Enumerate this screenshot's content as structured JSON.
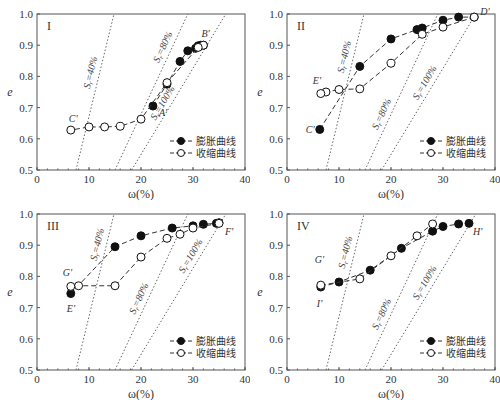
{
  "chart_data": [
    {
      "type": "line",
      "panel": "I",
      "xlabel": "ω(%)",
      "ylabel": "e",
      "xlim": [
        0,
        40
      ],
      "ylim": [
        0.5,
        1.0
      ],
      "xticks": [
        "0",
        "10",
        "20",
        "30",
        "40"
      ],
      "yticks": [
        "0.5",
        "0.6",
        "0.7",
        "0.8",
        "0.9",
        "1.0"
      ],
      "legend": [
        "膨胀曲线",
        "收缩曲线"
      ],
      "legend_position": "lower right",
      "series": [
        {
          "name": "膨胀曲线",
          "marker": "filled-circle",
          "x": [
            22.3,
            25,
            27.5,
            29,
            30.5,
            31,
            31.5,
            32
          ],
          "y": [
            0.705,
            0.775,
            0.848,
            0.882,
            0.89,
            0.898,
            0.9,
            0.9
          ]
        },
        {
          "name": "收缩曲线",
          "marker": "open-circle",
          "x": [
            32,
            31,
            25,
            20,
            16,
            13,
            10,
            6.5
          ],
          "y": [
            0.9,
            0.893,
            0.78,
            0.663,
            0.64,
            0.638,
            0.638,
            0.628
          ]
        }
      ],
      "annotations": [
        {
          "text": "A'",
          "x": 22.3,
          "y": 0.705
        },
        {
          "text": "B'",
          "x": 32,
          "y": 0.9
        },
        {
          "text": "C'",
          "x": 6.5,
          "y": 0.628
        }
      ],
      "saturation_lines": [
        {
          "label": "Sr=40%",
          "x": [
            7.5,
            14.8
          ],
          "y": [
            0.5,
            1.0
          ]
        },
        {
          "label": "Sr=80%",
          "x": [
            15,
            29
          ],
          "y": [
            0.5,
            1.0
          ]
        },
        {
          "label": "Sr=100%",
          "x": [
            18.2,
            36.3
          ],
          "y": [
            0.5,
            1.0
          ]
        }
      ]
    },
    {
      "type": "line",
      "panel": "II",
      "xlabel": "ω(%)",
      "ylabel": "e",
      "xlim": [
        0,
        40
      ],
      "ylim": [
        0.5,
        1.0
      ],
      "xticks": [
        "0",
        "10",
        "20",
        "30",
        "40"
      ],
      "yticks": [
        "0.5",
        "0.6",
        "0.7",
        "0.8",
        "0.9",
        "1.0"
      ],
      "legend": [
        "膨胀曲线",
        "收缩曲线"
      ],
      "legend_position": "lower right",
      "series": [
        {
          "name": "膨胀曲线",
          "marker": "filled-circle",
          "x": [
            6.3,
            14,
            20,
            25,
            26,
            30,
            33,
            36
          ],
          "y": [
            0.63,
            0.832,
            0.92,
            0.95,
            0.955,
            0.98,
            0.99,
            0.99
          ]
        },
        {
          "name": "收缩曲线",
          "marker": "open-circle",
          "x": [
            36,
            30,
            26,
            20,
            14,
            10,
            7.5,
            6.5
          ],
          "y": [
            0.99,
            0.958,
            0.935,
            0.842,
            0.76,
            0.758,
            0.75,
            0.745
          ]
        }
      ],
      "annotations": [
        {
          "text": "C'",
          "x": 6.3,
          "y": 0.63
        },
        {
          "text": "D'",
          "x": 36,
          "y": 0.99
        },
        {
          "text": "E'",
          "x": 6.5,
          "y": 0.745
        }
      ],
      "saturation_lines": [
        {
          "label": "Sr=40%",
          "x": [
            7.5,
            14.8
          ],
          "y": [
            0.5,
            1.0
          ]
        },
        {
          "label": "Sr=80%",
          "x": [
            15,
            29
          ],
          "y": [
            0.5,
            1.0
          ]
        },
        {
          "label": "Sr=100%",
          "x": [
            18.2,
            36.3
          ],
          "y": [
            0.5,
            1.0
          ]
        }
      ]
    },
    {
      "type": "line",
      "panel": "III",
      "xlabel": "ω(%)",
      "ylabel": "e",
      "xlim": [
        0,
        40
      ],
      "ylim": [
        0.5,
        1.0
      ],
      "xticks": [
        "0",
        "10",
        "20",
        "30",
        "40"
      ],
      "yticks": [
        "0.5",
        "0.6",
        "0.7",
        "0.8",
        "0.9",
        "1.0"
      ],
      "legend": [
        "膨胀曲线",
        "收缩曲线"
      ],
      "legend_position": "lower right",
      "series": [
        {
          "name": "膨胀曲线",
          "marker": "filled-circle",
          "x": [
            6.5,
            15,
            20,
            26,
            30,
            32,
            34.5,
            35
          ],
          "y": [
            0.745,
            0.895,
            0.93,
            0.955,
            0.962,
            0.967,
            0.97,
            0.972
          ]
        },
        {
          "name": "收缩曲线",
          "marker": "open-circle",
          "x": [
            35,
            30,
            27.5,
            25,
            20,
            15,
            8,
            6.5
          ],
          "y": [
            0.97,
            0.955,
            0.935,
            0.922,
            0.862,
            0.77,
            0.77,
            0.768
          ]
        }
      ],
      "annotations": [
        {
          "text": "E'",
          "x": 6.5,
          "y": 0.745
        },
        {
          "text": "F'",
          "x": 35,
          "y": 0.972
        },
        {
          "text": "G'",
          "x": 6.5,
          "y": 0.768
        }
      ],
      "saturation_lines": [
        {
          "label": "Sr=40%",
          "x": [
            7.5,
            14.8
          ],
          "y": [
            0.5,
            1.0
          ]
        },
        {
          "label": "Sr=80%",
          "x": [
            15,
            29
          ],
          "y": [
            0.5,
            1.0
          ]
        },
        {
          "label": "Sr=100%",
          "x": [
            18.2,
            36.3
          ],
          "y": [
            0.5,
            1.0
          ]
        }
      ]
    },
    {
      "type": "line",
      "panel": "IV",
      "xlabel": "ω(%)",
      "ylabel": "e",
      "xlim": [
        0,
        40
      ],
      "ylim": [
        0.5,
        1.0
      ],
      "xticks": [
        "0",
        "10",
        "20",
        "30",
        "40"
      ],
      "yticks": [
        "0.5",
        "0.6",
        "0.7",
        "0.8",
        "0.9",
        "1.0"
      ],
      "legend": [
        "膨胀曲线",
        "收缩曲线"
      ],
      "legend_position": "lower right",
      "series": [
        {
          "name": "膨胀曲线",
          "marker": "filled-circle",
          "x": [
            6.5,
            10,
            16,
            22,
            28,
            30,
            33,
            35
          ],
          "y": [
            0.766,
            0.782,
            0.82,
            0.89,
            0.945,
            0.96,
            0.968,
            0.97
          ]
        },
        {
          "name": "收缩曲线",
          "marker": "open-circle",
          "x": [
            6.5,
            14,
            20,
            25,
            28
          ],
          "y": [
            0.772,
            0.792,
            0.866,
            0.93,
            0.968
          ]
        }
      ],
      "annotations": [
        {
          "text": "G'",
          "x": 6.5,
          "y": 0.772
        },
        {
          "text": "H'",
          "x": 35,
          "y": 0.97
        },
        {
          "text": "I'",
          "x": 6.5,
          "y": 0.766
        }
      ],
      "saturation_lines": [
        {
          "label": "Sr=40%",
          "x": [
            7.5,
            14.8
          ],
          "y": [
            0.5,
            1.0
          ]
        },
        {
          "label": "Sr=80%",
          "x": [
            15,
            29
          ],
          "y": [
            0.5,
            1.0
          ]
        },
        {
          "label": "Sr=100%",
          "x": [
            18.2,
            36.3
          ],
          "y": [
            0.5,
            1.0
          ]
        }
      ]
    }
  ],
  "labels": {
    "xlabel": "ω(%)",
    "ylabel": "e",
    "legend_swell": "膨胀曲线",
    "legend_shrink": "收缩曲线",
    "sat40": "Sr=40%",
    "sat80": "Sr=80%",
    "sat100": "Sr=100%"
  },
  "colors": {
    "axis": "#555555",
    "series_line": "#333333",
    "marker_fill": "#111111",
    "sat_line": "#666666"
  }
}
